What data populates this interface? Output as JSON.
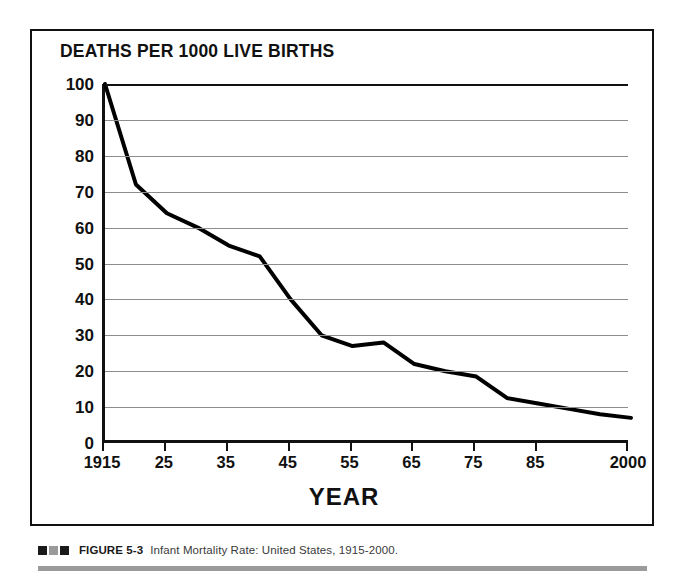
{
  "figure": {
    "chart_title": "DEATHS PER 1000 LIVE BIRTHS",
    "x_axis_title": "YEAR",
    "caption_label": "FIGURE 5-3",
    "caption_text": "Infant Mortality Rate: United States, 1915-2000.",
    "caption_squares": [
      "#1a1a1a",
      "#9a9a9a",
      "#1a1a1a"
    ],
    "rule_color": "#9b9b9b",
    "frame_color": "#111111"
  },
  "chart_data": {
    "type": "line",
    "title": "DEATHS PER 1000 LIVE BIRTHS",
    "xlabel": "YEAR",
    "ylabel": "DEATHS PER 1000 LIVE BIRTHS",
    "xlim": [
      1915,
      2000
    ],
    "ylim": [
      0,
      100
    ],
    "grid": true,
    "legend": "none",
    "line_color": "#000000",
    "line_width": 4,
    "x_tick_labels": [
      "1915",
      "25",
      "35",
      "45",
      "55",
      "65",
      "75",
      "85",
      "2000"
    ],
    "x_tick_values": [
      1915,
      1925,
      1935,
      1945,
      1955,
      1965,
      1975,
      1985,
      2000
    ],
    "y_tick_labels": [
      "100",
      "90",
      "80",
      "70",
      "60",
      "50",
      "40",
      "30",
      "20",
      "10",
      "0"
    ],
    "y_tick_values": [
      100,
      90,
      80,
      70,
      60,
      50,
      40,
      30,
      20,
      10,
      0
    ],
    "x": [
      1915,
      1920,
      1925,
      1930,
      1935,
      1940,
      1945,
      1950,
      1955,
      1960,
      1965,
      1970,
      1975,
      1980,
      1985,
      1990,
      1995,
      2000
    ],
    "values": [
      100,
      72,
      64,
      60,
      55,
      52,
      40,
      30,
      27,
      28,
      22,
      20,
      18.5,
      12.5,
      11,
      9.5,
      8,
      7
    ],
    "series": [
      {
        "name": "Infant mortality rate",
        "values": [
          100,
          72,
          64,
          60,
          55,
          52,
          40,
          30,
          27,
          28,
          22,
          20,
          18.5,
          12.5,
          11,
          9.5,
          8,
          7
        ]
      }
    ]
  }
}
